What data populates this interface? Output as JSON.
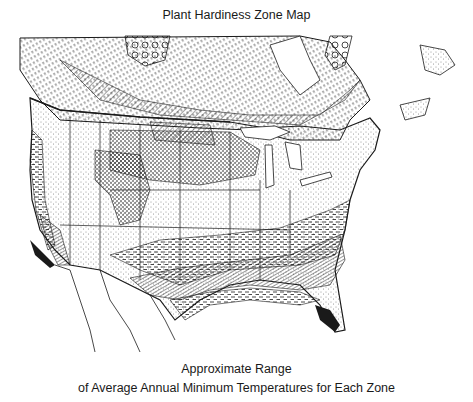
{
  "map": {
    "title": "Plant Hardiness Zone Map",
    "caption_line1": "Approximate Range",
    "caption_line2": "of Average Annual Minimum Temperatures for Each Zone",
    "region": "North America (Canada, United States, northern Mexico)",
    "colors": {
      "ink": "#1a1a1a",
      "background": "#ffffff"
    },
    "zone_patterns": [
      "large-circles",
      "dense-dashes",
      "diagonal-hatch",
      "coarse-dots",
      "fine-stipple",
      "blank",
      "horizontal-dashes",
      "cross-hatch",
      "solid-black"
    ]
  }
}
